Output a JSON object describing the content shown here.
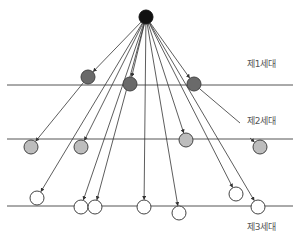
{
  "diagram": {
    "colors": {
      "line": "#555555",
      "arrow": "#333333",
      "root_fill": "#111111",
      "gen1_fill": "#6a6a6a",
      "gen2_fill": "#bdbdbd",
      "gen3_fill": "#ffffff",
      "node_stroke": "#444444"
    },
    "generation_lines": [
      {
        "name": "gen1-line",
        "y": 85,
        "x1": 7,
        "x2": 293
      },
      {
        "name": "gen2-line",
        "y": 139,
        "x1": 7,
        "x2": 293
      },
      {
        "name": "gen3-line",
        "y": 206,
        "x1": 7,
        "x2": 293
      }
    ],
    "labels": [
      {
        "name": "gen1-label",
        "text": "제1세대",
        "x": 247,
        "y": 64
      },
      {
        "name": "gen2-label",
        "text": "제2세대",
        "x": 247,
        "y": 120
      },
      {
        "name": "gen3-label",
        "text": "제3세대",
        "x": 247,
        "y": 222
      }
    ],
    "nodes": [
      {
        "id": "root",
        "gen": 0,
        "x": 146,
        "y": 17,
        "r": 7
      },
      {
        "id": "g1a",
        "gen": 1,
        "x": 88,
        "y": 77,
        "r": 7
      },
      {
        "id": "g1b",
        "gen": 1,
        "x": 130,
        "y": 84,
        "r": 7
      },
      {
        "id": "g1c",
        "gen": 1,
        "x": 194,
        "y": 84,
        "r": 7
      },
      {
        "id": "g2a",
        "gen": 2,
        "x": 31,
        "y": 147,
        "r": 7
      },
      {
        "id": "g2b",
        "gen": 2,
        "x": 81,
        "y": 147,
        "r": 7
      },
      {
        "id": "g2c",
        "gen": 2,
        "x": 186,
        "y": 140,
        "r": 7
      },
      {
        "id": "g2d",
        "gen": 2,
        "x": 260,
        "y": 147,
        "r": 7
      },
      {
        "id": "g3a",
        "gen": 3,
        "x": 37,
        "y": 198,
        "r": 7
      },
      {
        "id": "g3b",
        "gen": 3,
        "x": 81,
        "y": 207,
        "r": 7
      },
      {
        "id": "g3c",
        "gen": 3,
        "x": 95,
        "y": 207,
        "r": 7
      },
      {
        "id": "g3d",
        "gen": 3,
        "x": 144,
        "y": 207,
        "r": 7
      },
      {
        "id": "g3e",
        "gen": 3,
        "x": 179,
        "y": 213,
        "r": 7
      },
      {
        "id": "g3f",
        "gen": 3,
        "x": 236,
        "y": 194,
        "r": 7
      },
      {
        "id": "g3g",
        "gen": 3,
        "x": 258,
        "y": 207,
        "r": 7
      }
    ],
    "edges": [
      {
        "from": "root",
        "to": "g1a",
        "arrow": true
      },
      {
        "from": "root",
        "to": "g1b",
        "arrow": true
      },
      {
        "from": "root",
        "to": "g1c",
        "arrow": true
      },
      {
        "from": "root",
        "to": "g2b",
        "arrow": true
      },
      {
        "from": "root",
        "to": "g2c",
        "arrow": true
      },
      {
        "from": "root",
        "to": "g3b",
        "arrow": true
      },
      {
        "from": "root",
        "to": "g3c",
        "arrow": true
      },
      {
        "from": "root",
        "to": "g3d",
        "arrow": true
      },
      {
        "from": "root",
        "to": "g3e",
        "arrow": true
      },
      {
        "from": "root",
        "to": "g3f",
        "arrow": true
      },
      {
        "from": "root",
        "to": "g3g",
        "arrow": true
      },
      {
        "from": "g1a",
        "to": "g2a",
        "arrow": true
      },
      {
        "from": "root",
        "to": "g3a",
        "arrow": true
      },
      {
        "from": "g1c",
        "to": "g2label",
        "arrow": false,
        "x2": 240,
        "y2": 123
      },
      {
        "from": "g2label",
        "to": "g2d",
        "arrow": true,
        "x1": 250,
        "y1": 138
      }
    ]
  }
}
